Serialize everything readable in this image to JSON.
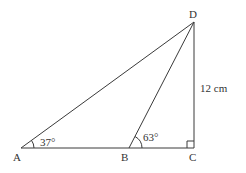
{
  "diagram": {
    "type": "geometry-triangle",
    "colors": {
      "stroke": "#3a3a3a",
      "text": "#333333",
      "background": "#ffffff"
    },
    "points": {
      "A": {
        "label": "A",
        "x": 21,
        "y": 148
      },
      "B": {
        "label": "B",
        "x": 129,
        "y": 148
      },
      "C": {
        "label": "C",
        "x": 194,
        "y": 148
      },
      "D": {
        "label": "D",
        "x": 194,
        "y": 22
      }
    },
    "segments": [
      "AB",
      "BC",
      "CD",
      "DA",
      "DB"
    ],
    "angles": {
      "A": {
        "label": "37°",
        "value": 37
      },
      "B": {
        "label": "63°",
        "value": 63
      },
      "C": {
        "label": "right-angle",
        "value": 90
      }
    },
    "lengths": {
      "DC": {
        "label": "12 cm",
        "value": 12,
        "unit": "cm"
      }
    }
  }
}
